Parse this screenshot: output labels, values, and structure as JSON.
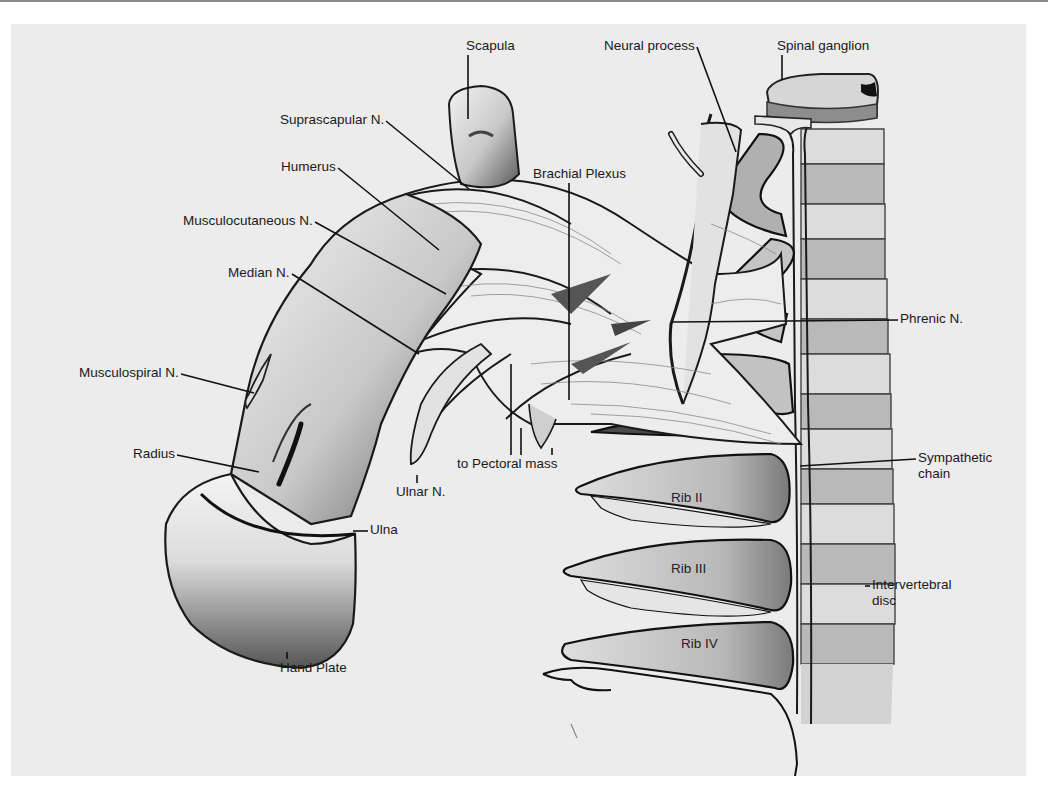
{
  "figure": {
    "colors": {
      "page": "#ffffff",
      "plate_background": "#ececec",
      "outline": "#1a1a1a",
      "bone_light": "#e4e4e4",
      "bone_mid": "#bdbdbd",
      "shadow": "#6e6e6e",
      "label_text": "#1a1a1a"
    }
  },
  "labels": [
    {
      "id": "scapula",
      "text": "Scapula",
      "x": 455,
      "y": 14,
      "tip": [
        457,
        95
      ]
    },
    {
      "id": "neural-process",
      "text": "Neural process",
      "x": 593,
      "y": 14,
      "tip": [
        725,
        128
      ]
    },
    {
      "id": "spinal-ganglion",
      "text": "Spinal ganglion",
      "x": 766,
      "y": 14,
      "tip": [
        771,
        56
      ]
    },
    {
      "id": "suprascapular-n",
      "text": "Suprascapular N.",
      "x": 269,
      "y": 88,
      "tip": [
        458,
        165
      ]
    },
    {
      "id": "brachial-plexus",
      "text": "Brachial Plexus",
      "x": 522,
      "y": 142,
      "tip": [
        558,
        376
      ]
    },
    {
      "id": "humerus",
      "text": "Humerus",
      "x": 270,
      "y": 135,
      "tip": [
        428,
        226
      ]
    },
    {
      "id": "musculocutaneous-n",
      "text": "Musculocutaneous N.",
      "x": 172,
      "y": 189,
      "tip": [
        435,
        270
      ]
    },
    {
      "id": "median-n",
      "text": "Median N.",
      "x": 217,
      "y": 241,
      "tip": [
        408,
        330
      ]
    },
    {
      "id": "phrenic-n",
      "text": "Phrenic N.",
      "x": 889,
      "y": 287,
      "tip": [
        661,
        298
      ]
    },
    {
      "id": "musculospiral-n",
      "text": "Musculospiral N.",
      "x": 68,
      "y": 341,
      "tip": [
        243,
        369
      ]
    },
    {
      "id": "radius",
      "text": "Radius",
      "x": 122,
      "y": 422,
      "tip": [
        248,
        448
      ]
    },
    {
      "id": "sympathetic-chain",
      "text": "Sympathetic\nchain",
      "x": 907,
      "y": 426,
      "tip": [
        789,
        442
      ]
    },
    {
      "id": "to-pectoral-mass",
      "text": "to Pectoral mass",
      "x": 446,
      "y": 432,
      "tips": [
        [
          500,
          340
        ],
        [
          510,
          404
        ],
        [
          541,
          424
        ]
      ]
    },
    {
      "id": "ulnar-n",
      "text": "Ulnar N.",
      "x": 385,
      "y": 460,
      "tip": [
        406,
        451
      ]
    },
    {
      "id": "ulna",
      "text": "Ulna",
      "x": 359,
      "y": 498,
      "tip": [
        342,
        507
      ]
    },
    {
      "id": "intervertebral-disc",
      "text": "Intervertebral\ndisc",
      "x": 861,
      "y": 553,
      "tip": [
        854,
        562
      ]
    },
    {
      "id": "hand-plate",
      "text": "Hand Plate",
      "x": 269,
      "y": 636,
      "tip": [
        276,
        628
      ]
    }
  ],
  "rib_labels": [
    {
      "id": "rib-ii",
      "text": "Rib II",
      "x": 660,
      "y": 466
    },
    {
      "id": "rib-iii",
      "text": "Rib III",
      "x": 660,
      "y": 537
    },
    {
      "id": "rib-iv",
      "text": "Rib IV",
      "x": 670,
      "y": 612
    }
  ]
}
